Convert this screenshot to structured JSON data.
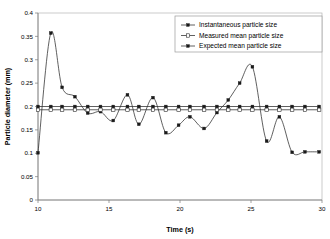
{
  "chart_data": {
    "type": "line",
    "title": "",
    "xlabel": "Time (s)",
    "ylabel": "Particle diameter (mm)",
    "xlim": [
      10,
      30
    ],
    "ylim": [
      0,
      0.4
    ],
    "xticks": [
      "10",
      "15",
      "20",
      "25",
      "30"
    ],
    "xtick_values": [
      10,
      15,
      20,
      25,
      30
    ],
    "yticks": [
      "0",
      "0.05",
      "0.1",
      "0.15",
      "0.2",
      "0.25",
      "0.3",
      "0.35",
      "0.4"
    ],
    "ytick_values": [
      0,
      0.05,
      0.1,
      0.15,
      0.2,
      0.25,
      0.3,
      0.35,
      0.4
    ],
    "grid": false,
    "legend_position": "top-right",
    "legend": [
      "Instantaneous particle size",
      "Measured mean particle size",
      "Expected mean particle size"
    ],
    "series": [
      {
        "name": "Instantaneous particle size",
        "marker": "filled-square",
        "x": [
          10.0,
          10.9,
          11.7,
          12.6,
          13.5,
          14.4,
          15.3,
          16.3,
          17.1,
          18.1,
          19.0,
          19.9,
          20.7,
          21.7,
          22.6,
          23.4,
          24.2,
          25.1,
          26.1,
          27.0,
          27.9,
          28.8,
          29.8
        ],
        "values": [
          0.101,
          0.357,
          0.241,
          0.221,
          0.186,
          0.189,
          0.17,
          0.225,
          0.162,
          0.219,
          0.144,
          0.16,
          0.178,
          0.153,
          0.187,
          0.214,
          0.25,
          0.285,
          0.126,
          0.178,
          0.102,
          0.103,
          0.103
        ]
      },
      {
        "name": "Measured mean particle size",
        "marker": "open-square",
        "constant_value": 0.193,
        "x": [
          10.0,
          10.9,
          11.7,
          12.6,
          13.5,
          14.4,
          15.3,
          16.3,
          17.1,
          18.1,
          19.0,
          19.9,
          20.7,
          21.7,
          22.6,
          23.4,
          24.2,
          25.1,
          26.1,
          27.0,
          27.9,
          28.8,
          29.8
        ],
        "values": [
          0.193,
          0.193,
          0.193,
          0.193,
          0.193,
          0.193,
          0.193,
          0.193,
          0.193,
          0.193,
          0.193,
          0.193,
          0.193,
          0.193,
          0.193,
          0.193,
          0.193,
          0.193,
          0.193,
          0.193,
          0.193,
          0.193,
          0.193
        ]
      },
      {
        "name": "Expected mean particle size",
        "marker": "filled-square",
        "constant_value": 0.2,
        "x": [
          10.0,
          10.9,
          11.7,
          12.6,
          13.5,
          14.4,
          15.3,
          16.3,
          17.1,
          18.1,
          19.0,
          19.9,
          20.7,
          21.7,
          22.6,
          23.4,
          24.2,
          25.1,
          26.1,
          27.0,
          27.9,
          28.8,
          29.8
        ],
        "values": [
          0.2,
          0.2,
          0.2,
          0.2,
          0.2,
          0.2,
          0.2,
          0.2,
          0.2,
          0.2,
          0.2,
          0.2,
          0.2,
          0.2,
          0.2,
          0.2,
          0.2,
          0.2,
          0.2,
          0.2,
          0.2,
          0.2,
          0.2
        ]
      }
    ]
  },
  "colors": {
    "series_line": "#2b2b2b",
    "axis": "#7a7a7a",
    "frame": "#b5b5b5",
    "background": "#ffffff"
  }
}
